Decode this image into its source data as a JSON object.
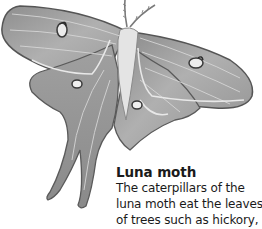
{
  "illustration": {
    "subject": "luna-moth-illustration",
    "colors": {
      "wing_fill": "#a9a9a9",
      "wing_dark": "#6e6e6e",
      "wing_edge": "#4a4a4a",
      "vein": "#d8d8d8",
      "body": "#e6e6e6"
    }
  },
  "caption": {
    "title": "Luna moth",
    "lines": [
      "The caterpillars of the",
      "luna moth eat the leaves",
      "of trees such as hickory,"
    ]
  }
}
